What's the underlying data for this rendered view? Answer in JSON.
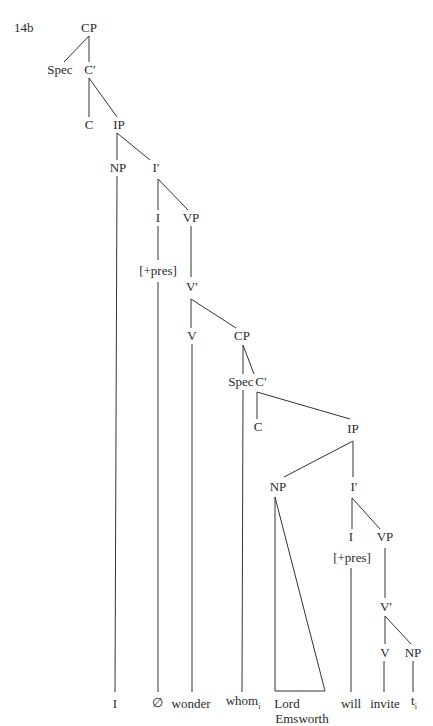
{
  "example_number": "14b",
  "nodes": {
    "cp1": "CP",
    "spec1": "Spec",
    "cbar1": "C′",
    "c1": "C",
    "ip1": "IP",
    "np1": "NP",
    "ibar1": "I′",
    "i1": "I",
    "vp1": "VP",
    "feat1": "[+pres]",
    "vbar1": "V′",
    "v1": "V",
    "cp2": "CP",
    "spec2": "Spec",
    "cbar2": "C′",
    "c2": "C",
    "ip2": "IP",
    "np2": "NP",
    "ibar2": "I′",
    "i2": "I",
    "vp2": "VP",
    "feat2": "[+pres]",
    "vbar2": "V′",
    "v2": "V",
    "np3": "NP"
  },
  "leaves": {
    "i": "I",
    "null": "∅",
    "wonder": "wonder",
    "whom": "whom",
    "whom_index": "i",
    "lord": "Lord",
    "emsworth": "Emsworth",
    "will": "will",
    "invite": "invite",
    "trace": "t",
    "trace_index": "i"
  }
}
